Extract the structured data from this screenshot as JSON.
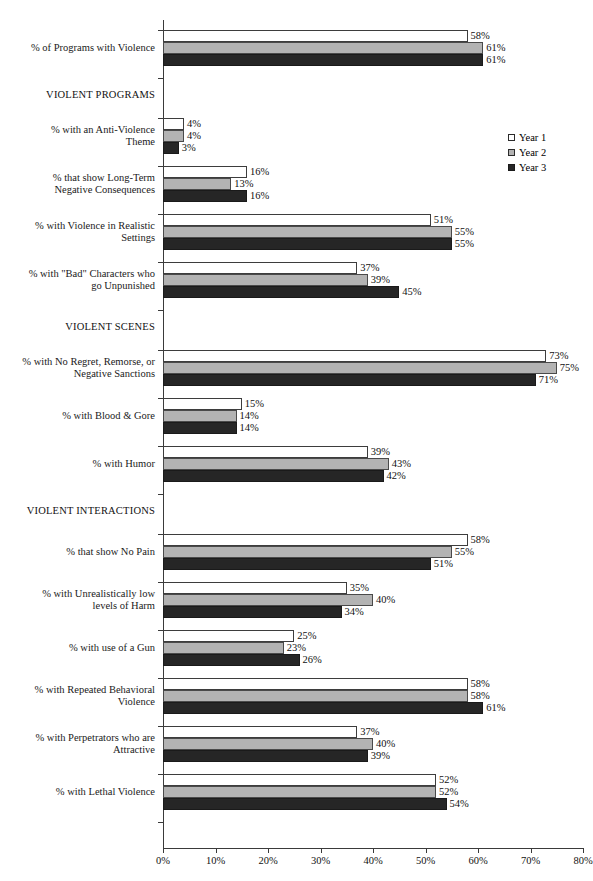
{
  "chart_data": {
    "type": "bar",
    "orientation": "horizontal",
    "title": "",
    "xlabel": "",
    "ylabel": "",
    "xlim": [
      0,
      80
    ],
    "xticks": [
      0,
      10,
      20,
      30,
      40,
      50,
      60,
      70,
      80
    ],
    "xtick_labels": [
      "0%",
      "10%",
      "20%",
      "30%",
      "40%",
      "50%",
      "60%",
      "70%",
      "80%"
    ],
    "grid": false,
    "value_suffix": "%",
    "legend": {
      "position": "top-right",
      "entries": [
        {
          "name": "Year 1",
          "color": "#ffffff"
        },
        {
          "name": "Year 2",
          "color": "#b3b3b3"
        },
        {
          "name": "Year 3",
          "color": "#262626"
        }
      ]
    },
    "series": [
      {
        "name": "Year 1",
        "color": "#ffffff"
      },
      {
        "name": "Year 2",
        "color": "#b3b3b3"
      },
      {
        "name": "Year 3",
        "color": "#262626"
      }
    ],
    "sections": [
      {
        "label": "VIOLENT PROGRAMS"
      },
      {
        "label": "VIOLENT SCENES"
      },
      {
        "label": "VIOLENT INTERACTIONS"
      }
    ],
    "categories": [
      "% of Programs with Violence",
      "% with an Anti-Violence Theme",
      "% that show Long-Term Negative Consequences",
      "% with Violence in Realistic Settings",
      "% with \"Bad\" Characters who go Unpunished",
      "% with No Regret, Remorse, or Negative Sanctions",
      "% with Blood & Gore",
      "% with Humor",
      "% that show No Pain",
      "% with Unrealistically low levels of Harm",
      "% with use of a Gun",
      "% with Repeated Behavioral Violence",
      "% with Perpetrators who are Attractive",
      "% with Lethal Violence"
    ],
    "values": {
      "Year 1": [
        58,
        4,
        16,
        51,
        37,
        73,
        15,
        39,
        58,
        35,
        25,
        58,
        37,
        52
      ],
      "Year 2": [
        61,
        4,
        13,
        55,
        39,
        75,
        14,
        43,
        55,
        40,
        23,
        58,
        40,
        52
      ],
      "Year 3": [
        61,
        3,
        16,
        55,
        45,
        71,
        14,
        42,
        51,
        34,
        26,
        61,
        39,
        54
      ]
    }
  },
  "rows": [
    {
      "kind": "group",
      "label_lines": [
        "% of Programs with Violence"
      ],
      "v": [
        58,
        61,
        61
      ],
      "t": [
        58,
        61,
        61
      ]
    },
    {
      "kind": "section",
      "label_lines": [
        "VIOLENT PROGRAMS"
      ]
    },
    {
      "kind": "group",
      "label_lines": [
        "% with an Anti-Violence",
        "Theme"
      ],
      "v": [
        4,
        4,
        3
      ],
      "t": [
        4,
        4,
        3
      ]
    },
    {
      "kind": "group",
      "label_lines": [
        "% that show Long-Term",
        "Negative Consequences"
      ],
      "v": [
        16,
        13,
        16
      ],
      "t": [
        16,
        13,
        16
      ]
    },
    {
      "kind": "group",
      "label_lines": [
        "% with Violence in Realistic",
        "Settings"
      ],
      "v": [
        51,
        55,
        55
      ],
      "t": [
        51,
        55,
        55
      ]
    },
    {
      "kind": "group",
      "label_lines": [
        "% with \"Bad\" Characters who",
        "go Unpunished"
      ],
      "v": [
        37,
        39,
        45
      ],
      "t": [
        37,
        39,
        45
      ]
    },
    {
      "kind": "section",
      "label_lines": [
        "VIOLENT SCENES"
      ]
    },
    {
      "kind": "group",
      "label_lines": [
        "% with No Regret, Remorse, or",
        "Negative Sanctions"
      ],
      "v": [
        73,
        75,
        71
      ],
      "t": [
        73,
        75,
        71
      ]
    },
    {
      "kind": "group",
      "label_lines": [
        "% with Blood & Gore"
      ],
      "v": [
        15,
        14,
        14
      ],
      "t": [
        15,
        14,
        14
      ]
    },
    {
      "kind": "group",
      "label_lines": [
        "% with Humor"
      ],
      "v": [
        39,
        43,
        42
      ],
      "t": [
        39,
        43,
        42
      ]
    },
    {
      "kind": "section",
      "label_lines": [
        "VIOLENT INTERACTIONS"
      ]
    },
    {
      "kind": "group",
      "label_lines": [
        "% that show No Pain"
      ],
      "v": [
        58,
        55,
        51
      ],
      "t": [
        58,
        55,
        51
      ]
    },
    {
      "kind": "group",
      "label_lines": [
        "% with Unrealistically low",
        "levels of Harm"
      ],
      "v": [
        35,
        40,
        34
      ],
      "t": [
        35,
        40,
        34
      ]
    },
    {
      "kind": "group",
      "label_lines": [
        "% with use of a Gun"
      ],
      "v": [
        25,
        23,
        26
      ],
      "t": [
        25,
        23,
        26
      ]
    },
    {
      "kind": "group",
      "label_lines": [
        "% with Repeated Behavioral",
        "Violence"
      ],
      "v": [
        58,
        58,
        61
      ],
      "t": [
        58,
        58,
        61
      ]
    },
    {
      "kind": "group",
      "label_lines": [
        "% with Perpetrators who are",
        "Attractive"
      ],
      "v": [
        37,
        40,
        39
      ],
      "t": [
        37,
        40,
        39
      ]
    },
    {
      "kind": "group",
      "label_lines": [
        "% with Lethal Violence"
      ],
      "v": [
        52,
        52,
        54
      ],
      "t": [
        52,
        52,
        54
      ]
    }
  ],
  "axis": {
    "tick_labels": [
      "0%",
      "10%",
      "20%",
      "30%",
      "40%",
      "50%",
      "60%",
      "70%",
      "80%"
    ]
  },
  "legend": {
    "items": [
      "Year 1",
      "Year 2",
      "Year 3"
    ]
  }
}
